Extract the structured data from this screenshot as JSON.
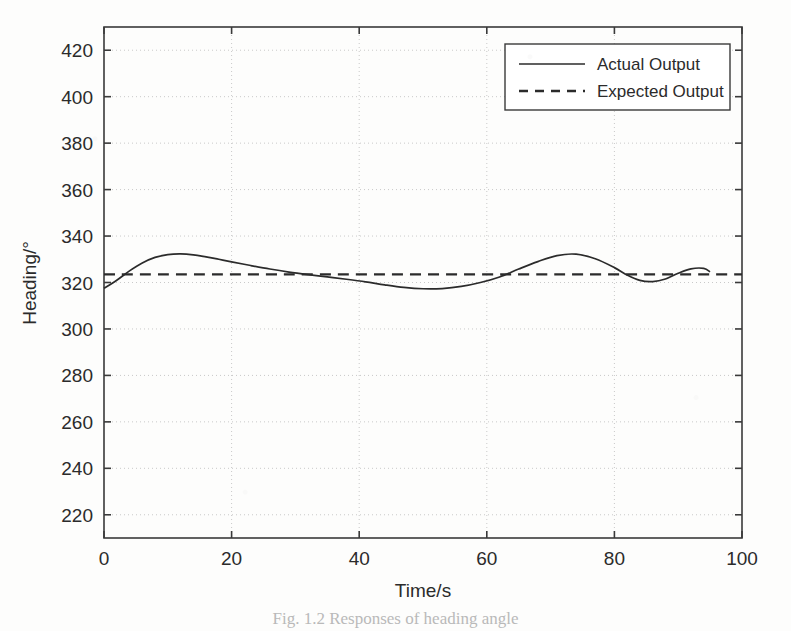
{
  "figure": {
    "caption": "Fig. 1.2  Responses of heading angle",
    "background_color": "#fdfdfc",
    "ink_color": "#2b2b2b"
  },
  "chart_data": {
    "type": "line",
    "title": "",
    "xlabel": "Time/s",
    "ylabel": "Heading/°",
    "xlim": [
      0,
      100
    ],
    "ylim": [
      210,
      430
    ],
    "xticks": [
      0,
      20,
      40,
      60,
      80,
      100
    ],
    "yticks": [
      220,
      240,
      260,
      280,
      300,
      320,
      340,
      360,
      380,
      400,
      420
    ],
    "xtick_labels": [
      "0",
      "20",
      "40",
      "60",
      "80",
      "100"
    ],
    "ytick_labels": [
      "220",
      "240",
      "260",
      "280",
      "300",
      "320",
      "340",
      "360",
      "380",
      "400",
      "420"
    ],
    "grid": true,
    "grid_style": "dotted",
    "legend_position": "upper right",
    "series": [
      {
        "name": "Actual Output",
        "style": "solid",
        "color": "#2b2b2b",
        "x": [
          0,
          2,
          4,
          6,
          8,
          10,
          12,
          14,
          16,
          18,
          20,
          23,
          26,
          29,
          32,
          35,
          38,
          41,
          44,
          47,
          50,
          53,
          56,
          59,
          62,
          65,
          68,
          71,
          74,
          77,
          80,
          82,
          84,
          86,
          88,
          90,
          92,
          94,
          95
        ],
        "y": [
          317.5,
          321.0,
          325.0,
          328.4,
          330.8,
          332.0,
          332.3,
          331.9,
          331.0,
          330.0,
          328.9,
          327.3,
          325.8,
          324.5,
          323.4,
          322.4,
          321.4,
          320.3,
          319.0,
          317.9,
          317.3,
          317.4,
          318.3,
          320.0,
          322.4,
          325.8,
          329.0,
          331.6,
          332.2,
          330.2,
          326.4,
          323.2,
          320.9,
          320.4,
          321.5,
          324.0,
          325.9,
          326.1,
          324.6
        ]
      },
      {
        "name": "Expected Output",
        "style": "dashed",
        "color": "#2b2b2b",
        "x": [
          0,
          100
        ],
        "y": [
          323.5,
          323.5
        ]
      }
    ]
  },
  "legend": {
    "entries": [
      {
        "label": "Actual Output",
        "style": "solid"
      },
      {
        "label": "Expected Output",
        "style": "dashed"
      }
    ]
  }
}
